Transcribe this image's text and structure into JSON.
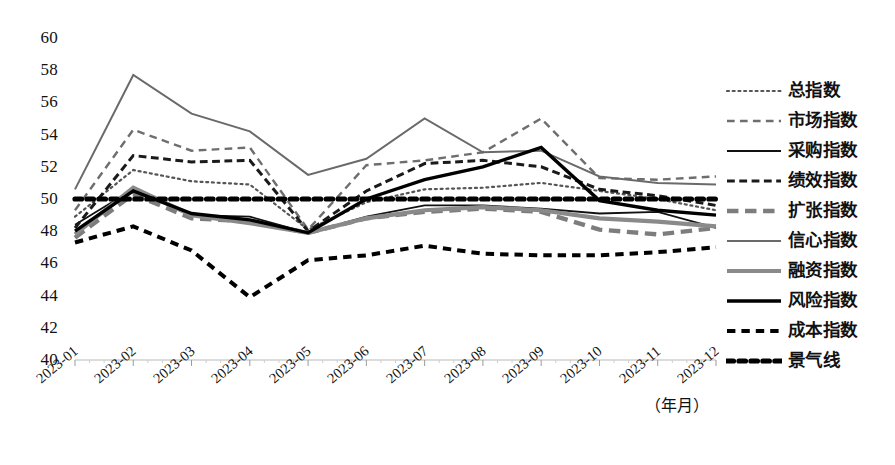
{
  "chart_data": {
    "type": "line",
    "title": "",
    "xlabel": "（年月）",
    "ylabel": "",
    "ylim": [
      40,
      60
    ],
    "ytick_step": 2,
    "yticks": [
      60,
      58,
      56,
      54,
      52,
      50,
      48,
      46,
      44,
      42,
      40
    ],
    "grid": false,
    "legend_position": "right",
    "categories": [
      "2023-01",
      "2023-02",
      "2023-03",
      "2023-04",
      "2023-05",
      "2023-06",
      "2023-07",
      "2023-08",
      "2023-09",
      "2023-10",
      "2023-11",
      "2023-12"
    ],
    "series": [
      {
        "name": "总指数",
        "style": "dotted",
        "color": "#555555",
        "width": 2.2,
        "values": [
          48.9,
          51.8,
          51.1,
          50.9,
          48.1,
          49.8,
          50.6,
          50.7,
          51.0,
          50.5,
          50.0,
          49.3
        ]
      },
      {
        "name": "市场指数",
        "style": "dashed",
        "color": "#6e6e6e",
        "width": 2.4,
        "values": [
          49.3,
          54.3,
          53.0,
          53.2,
          48.1,
          52.1,
          52.4,
          52.9,
          55.0,
          51.3,
          51.2,
          51.4
        ]
      },
      {
        "name": "采购指数",
        "style": "solid",
        "color": "#111111",
        "width": 1.8,
        "values": [
          48.4,
          50.6,
          49.0,
          48.9,
          47.9,
          48.9,
          49.6,
          49.6,
          49.4,
          49.1,
          49.2,
          48.2
        ]
      },
      {
        "name": "绩效指数",
        "style": "dashed-tight",
        "color": "#1a1a1a",
        "width": 3.0,
        "values": [
          48.2,
          52.7,
          52.3,
          52.4,
          48.0,
          50.5,
          52.2,
          52.4,
          52.0,
          50.6,
          50.2,
          49.6
        ]
      },
      {
        "name": "扩张指数",
        "style": "dashed-thick",
        "color": "#7d7d7d",
        "width": 4.4,
        "values": [
          47.6,
          50.3,
          48.8,
          48.6,
          47.9,
          48.8,
          49.2,
          49.4,
          49.2,
          48.1,
          47.8,
          48.2
        ]
      },
      {
        "name": "信心指数",
        "style": "solid",
        "color": "#6a6a6a",
        "width": 2.0,
        "values": [
          50.6,
          57.7,
          55.3,
          54.2,
          51.5,
          52.5,
          55.0,
          52.9,
          53.0,
          51.4,
          51.0,
          50.9
        ]
      },
      {
        "name": "融资指数",
        "style": "solid-thick",
        "color": "#8a8a8a",
        "width": 4.2,
        "values": [
          47.8,
          50.7,
          49.0,
          48.5,
          47.9,
          48.8,
          49.3,
          49.5,
          49.3,
          48.8,
          48.6,
          48.3
        ]
      },
      {
        "name": "风险指数",
        "style": "solid-bold",
        "color": "#000000",
        "width": 3.4,
        "values": [
          48.0,
          50.5,
          49.1,
          48.7,
          47.9,
          50.0,
          51.2,
          52.0,
          53.2,
          49.9,
          49.3,
          49.0
        ]
      },
      {
        "name": "成本指数",
        "style": "dashed-bold",
        "color": "#000000",
        "width": 4.0,
        "values": [
          47.3,
          48.3,
          46.8,
          43.9,
          46.2,
          46.5,
          47.1,
          46.6,
          46.5,
          46.5,
          46.7,
          47.0
        ]
      },
      {
        "name": "景气线",
        "style": "dotted-bold",
        "color": "#000000",
        "width": 5.2,
        "values": [
          50,
          50,
          50,
          50,
          50,
          50,
          50,
          50,
          50,
          50,
          50,
          50
        ]
      }
    ]
  },
  "legend": {
    "items": [
      {
        "label": "总指数"
      },
      {
        "label": "市场指数"
      },
      {
        "label": "采购指数"
      },
      {
        "label": "绩效指数"
      },
      {
        "label": "扩张指数"
      },
      {
        "label": "信心指数"
      },
      {
        "label": "融资指数"
      },
      {
        "label": "风险指数"
      },
      {
        "label": "成本指数"
      },
      {
        "label": "景气线"
      }
    ]
  },
  "axis": {
    "unit_note": "（年月）"
  }
}
